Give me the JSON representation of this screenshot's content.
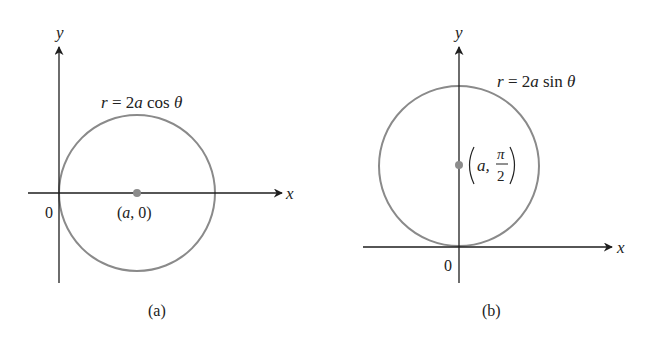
{
  "figure": {
    "colors": {
      "axis": "#1e1e1e",
      "circle": "#8a8a8a",
      "center_dot": "#8c8c8c",
      "text": "#222222",
      "background": "#ffffff"
    },
    "panels": [
      {
        "id": "a",
        "caption": "(a)",
        "equation": {
          "lhs": "r",
          "eq": " = 2",
          "a": "a",
          "fn": " cos ",
          "theta": "θ"
        },
        "axis_labels": {
          "x": "x",
          "y": "y",
          "origin": "0"
        },
        "center_label": {
          "open": "(",
          "a": "a",
          "rest": ", 0)"
        },
        "center_polar": "(a, 0)"
      },
      {
        "id": "b",
        "caption": "(b)",
        "equation": {
          "lhs": "r",
          "eq": " = 2",
          "a": "a",
          "fn": " sin ",
          "theta": "θ"
        },
        "axis_labels": {
          "x": "x",
          "y": "y",
          "origin": "0"
        },
        "center_label": {
          "a": "a,",
          "num": "π",
          "den": "2"
        },
        "center_polar": "(a, π/2)"
      }
    ]
  }
}
